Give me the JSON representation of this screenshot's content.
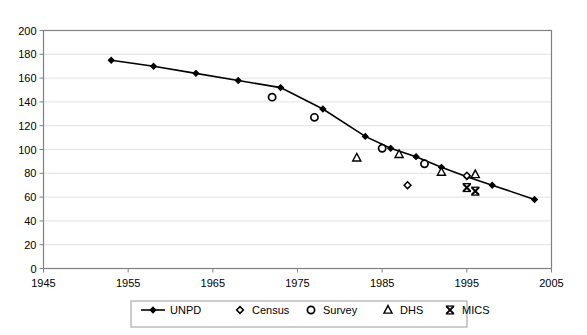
{
  "chart_data": {
    "type": "line",
    "title": "",
    "subtitle": "",
    "xlabel": "",
    "ylabel": "",
    "xlim": [
      1945,
      2005
    ],
    "ylim": [
      0,
      200
    ],
    "grid": "horizontal",
    "legend_position": "bottom",
    "x_ticks": [
      "1945",
      "1955",
      "1965",
      "1975",
      "1985",
      "1995",
      "2005"
    ],
    "x_tick_values": [
      1945,
      1955,
      1965,
      1975,
      1985,
      1995,
      2005
    ],
    "y_ticks": [
      "0",
      "20",
      "40",
      "60",
      "80",
      "100",
      "120",
      "140",
      "160",
      "180",
      "200"
    ],
    "y_tick_values": [
      0,
      20,
      40,
      60,
      80,
      100,
      120,
      140,
      160,
      180,
      200
    ],
    "series": [
      {
        "name": "UNPD",
        "marker": "filled-diamond",
        "line": true,
        "color": "#000000",
        "points": [
          {
            "x": 1953,
            "y": 175
          },
          {
            "x": 1958,
            "y": 170
          },
          {
            "x": 1963,
            "y": 164
          },
          {
            "x": 1968,
            "y": 158
          },
          {
            "x": 1973,
            "y": 152
          },
          {
            "x": 1978,
            "y": 134
          },
          {
            "x": 1983,
            "y": 111
          },
          {
            "x": 1986,
            "y": 101
          },
          {
            "x": 1989,
            "y": 94
          },
          {
            "x": 1992,
            "y": 85
          },
          {
            "x": 1995,
            "y": 77
          },
          {
            "x": 1998,
            "y": 70
          },
          {
            "x": 2003,
            "y": 58
          }
        ]
      },
      {
        "name": "Census",
        "marker": "open-diamond",
        "line": false,
        "color": "#000000",
        "points": [
          {
            "x": 1988,
            "y": 70
          },
          {
            "x": 1995,
            "y": 78
          }
        ]
      },
      {
        "name": "Survey",
        "marker": "open-circle",
        "line": false,
        "color": "#000000",
        "points": [
          {
            "x": 1972,
            "y": 144
          },
          {
            "x": 1977,
            "y": 127
          },
          {
            "x": 1985,
            "y": 101
          },
          {
            "x": 1990,
            "y": 88
          }
        ]
      },
      {
        "name": "DHS",
        "marker": "open-triangle",
        "line": false,
        "color": "#000000",
        "points": [
          {
            "x": 1982,
            "y": 93
          },
          {
            "x": 1987,
            "y": 96
          },
          {
            "x": 1992,
            "y": 81
          },
          {
            "x": 1996,
            "y": 79
          }
        ]
      },
      {
        "name": "MICS",
        "marker": "cross-x",
        "line": false,
        "color": "#000000",
        "points": [
          {
            "x": 1995,
            "y": 68
          },
          {
            "x": 1996,
            "y": 65
          }
        ]
      }
    ]
  },
  "legend": {
    "entries": [
      {
        "label": "UNPD",
        "marker": "line-filled-diamond"
      },
      {
        "label": "Census",
        "marker": "open-diamond"
      },
      {
        "label": "Survey",
        "marker": "open-circle"
      },
      {
        "label": "DHS",
        "marker": "open-triangle"
      },
      {
        "label": "MICS",
        "marker": "cross-x"
      }
    ]
  }
}
